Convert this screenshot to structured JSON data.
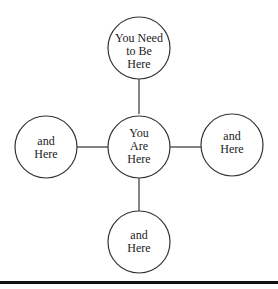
{
  "diagram": {
    "nodes": [
      {
        "id": "top",
        "lines": [
          "You Need",
          "to Be",
          "Here"
        ]
      },
      {
        "id": "center",
        "lines": [
          "You",
          "Are",
          "Here"
        ]
      },
      {
        "id": "left",
        "lines": [
          "and",
          "Here"
        ]
      },
      {
        "id": "right",
        "lines": [
          "and",
          "Here"
        ]
      },
      {
        "id": "bottom",
        "lines": [
          "and",
          "Here"
        ]
      }
    ],
    "edges": [
      {
        "from": "center",
        "to": "top"
      },
      {
        "from": "center",
        "to": "left"
      },
      {
        "from": "center",
        "to": "right"
      },
      {
        "from": "center",
        "to": "bottom"
      }
    ]
  }
}
